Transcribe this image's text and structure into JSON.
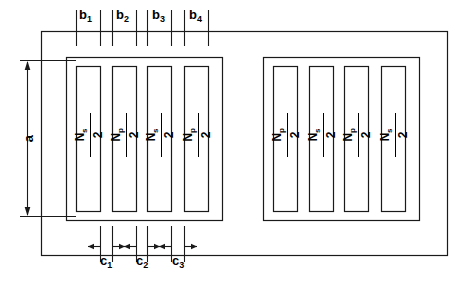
{
  "figure": {
    "stroke_color": "#1a1a1a",
    "background_color": "#ffffff"
  },
  "dimensions": {
    "vertical": {
      "label": "a",
      "name": "window-height-a"
    },
    "top": [
      {
        "label": "b",
        "subscript": "1"
      },
      {
        "label": "b",
        "subscript": "2"
      },
      {
        "label": "b",
        "subscript": "3"
      },
      {
        "label": "b",
        "subscript": "4"
      }
    ],
    "bottom": [
      {
        "label": "c",
        "subscript": "1"
      },
      {
        "label": "c",
        "subscript": "2"
      },
      {
        "label": "c",
        "subscript": "3"
      }
    ]
  },
  "windings": {
    "left_group": [
      {
        "symbol": "N",
        "subscript": "s",
        "denominator": "2"
      },
      {
        "symbol": "N",
        "subscript": "p",
        "denominator": "2"
      },
      {
        "symbol": "N",
        "subscript": "s",
        "denominator": "2"
      },
      {
        "symbol": "N",
        "subscript": "p",
        "denominator": "2"
      }
    ],
    "right_group": [
      {
        "symbol": "N",
        "subscript": "p",
        "denominator": "2"
      },
      {
        "symbol": "N",
        "subscript": "s",
        "denominator": "2"
      },
      {
        "symbol": "N",
        "subscript": "p",
        "denominator": "2"
      },
      {
        "symbol": "N",
        "subscript": "s",
        "denominator": "2"
      }
    ]
  }
}
